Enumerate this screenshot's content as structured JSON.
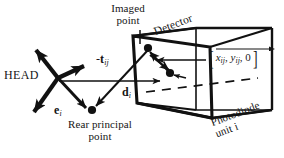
{
  "figure": {
    "title_alt": "Camera geometry diagram of detector photodiode unit",
    "labels": {
      "head": "HEAD",
      "imaged_point_line1": "Imaged",
      "imaged_point_line2": "point",
      "rear_principal_line1": "Rear principal",
      "rear_principal_line2": "point",
      "detector": "Detector",
      "photodiode_line1": "Photodiode",
      "photodiode_line2": "unit i",
      "vector_t_sign": "-",
      "vector_t_symbol": "t",
      "vector_t_subscript": "ij",
      "vector_d_symbol": "d",
      "vector_d_subscript": "i",
      "vector_e_symbol": "e",
      "vector_e_subscript": "i",
      "bracket_open": "[",
      "bracket_close": "]",
      "bracket_x": "x",
      "bracket_x_sub": "ij",
      "bracket_sep1": ", ",
      "bracket_y": "y",
      "bracket_y_sub": "ij",
      "bracket_sep2": ", ",
      "bracket_zero": "0"
    },
    "colors": {
      "ink": "#151515",
      "stroke": "#111111",
      "background": "#ffffff"
    }
  }
}
